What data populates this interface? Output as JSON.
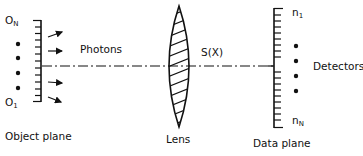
{
  "diagram": {
    "type": "optical imaging schematic",
    "object_plane": {
      "label": "Object plane",
      "top_label": "O",
      "top_sub": "N",
      "bottom_label": "O",
      "bottom_sub": "1",
      "dots": 4,
      "ticks": 13
    },
    "photons": {
      "label": "Photons",
      "arrows": 4
    },
    "lens": {
      "label": "Lens",
      "function_label": "S(X)"
    },
    "data_plane": {
      "label": "Data plane",
      "top_label": "n",
      "top_sub": "1",
      "bottom_label": "n",
      "bottom_sub": "N",
      "dots": 4,
      "ticks": 20
    },
    "detectors": {
      "label": "Detectors"
    },
    "colors": {
      "stroke": "#111111",
      "background": "#ffffff"
    }
  }
}
